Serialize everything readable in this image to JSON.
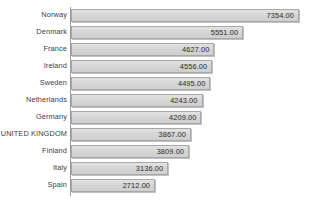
{
  "chart_data": {
    "type": "bar",
    "orientation": "horizontal",
    "title": "",
    "subtitle": "",
    "xlabel": "",
    "ylabel": "",
    "grid": false,
    "legend": null,
    "legend_position": "none",
    "xlim": [
      0,
      7354
    ],
    "value_label_format": "0.00",
    "categories": [
      "Norway",
      "Denmark",
      "France",
      "Ireland",
      "Sweden",
      "Netherlands",
      "Germany",
      "UNITED KINGDOM",
      "Finland",
      "Italy",
      "Spain"
    ],
    "values": [
      7354.0,
      5551.0,
      4627.0,
      4556.0,
      4495.0,
      4243.0,
      4209.0,
      3867.0,
      3809.0,
      3136.0,
      2712.0
    ],
    "value_labels": [
      "7354.00",
      "5551.00",
      "4627.00",
      "4556.00",
      "4495.00",
      "4243.00",
      "4209.00",
      "3867.00",
      "3809.00",
      "3136.00",
      "2712.00"
    ],
    "bars": [
      {
        "category": "Norway",
        "value": 7354.0,
        "label": "7354.00"
      },
      {
        "category": "Denmark",
        "value": 5551.0,
        "label": "5551.00"
      },
      {
        "category": "France",
        "value": 4627.0,
        "label": "4627.00"
      },
      {
        "category": "Ireland",
        "value": 4556.0,
        "label": "4556.00"
      },
      {
        "category": "Sweden",
        "value": 4495.0,
        "label": "4495.00"
      },
      {
        "category": "Netherlands",
        "value": 4243.0,
        "label": "4243.00"
      },
      {
        "category": "Germany",
        "value": 4209.0,
        "label": "4209.00"
      },
      {
        "category": "UNITED KINGDOM",
        "value": 3867.0,
        "label": "3867.00"
      },
      {
        "category": "Finland",
        "value": 3809.0,
        "label": "3809.00"
      },
      {
        "category": "Italy",
        "value": 3136.0,
        "label": "3136.00"
      },
      {
        "category": "Spain",
        "value": 2712.0,
        "label": "2712.00"
      }
    ],
    "colors": {
      "bar_fill": "#d9d9d9",
      "bar_border": "#a8a8a8",
      "axis_line": "#9a9a9a",
      "category_text": "#3d3d3d",
      "value_text": "#2b2b2b",
      "background": "#ffffff"
    }
  }
}
